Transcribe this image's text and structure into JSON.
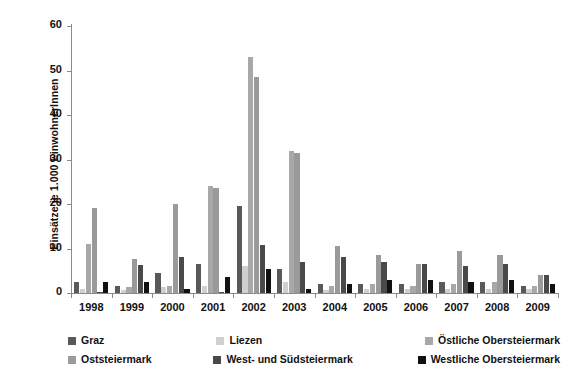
{
  "chart_data": {
    "type": "bar",
    "title": "",
    "subtitle": "",
    "xlabel": "",
    "ylabel": "Einsätze je 1.000 EinwohnerInnen",
    "ylim": [
      0,
      60
    ],
    "yticks": [
      0,
      10,
      20,
      30,
      40,
      50,
      60
    ],
    "ytick_labels": [
      "0",
      "10",
      "20",
      "30",
      "40",
      "50",
      "60"
    ],
    "grid": false,
    "legend_position": "bottom",
    "categories": [
      "1998",
      "1999",
      "2000",
      "2001",
      "2002",
      "2003",
      "2004",
      "2005",
      "2006",
      "2007",
      "2008",
      "2009"
    ],
    "series": [
      {
        "name": "Graz",
        "color": "#595959",
        "values": [
          2.5,
          1.6,
          4.6,
          6.6,
          19.6,
          5.5,
          2.0,
          2.0,
          2.0,
          2.5,
          2.5,
          1.5
        ]
      },
      {
        "name": "Liezen",
        "color": "#d0d0d0",
        "values": [
          1.0,
          0.6,
          1.4,
          1.5,
          6.0,
          2.5,
          0.6,
          1.0,
          1.0,
          1.0,
          1.0,
          1.0
        ]
      },
      {
        "name": "Östliche Obersteiermark",
        "color": "#a8a8a8",
        "values": [
          11.0,
          1.3,
          1.5,
          24.0,
          53.0,
          32.0,
          1.5,
          2.0,
          1.5,
          2.0,
          2.5,
          1.5
        ]
      },
      {
        "name": "Oststeiermark",
        "color": "#9a9a9a",
        "values": [
          19.0,
          7.7,
          20.0,
          23.5,
          48.5,
          31.5,
          10.5,
          8.5,
          6.5,
          9.5,
          8.5,
          4.0
        ]
      },
      {
        "name": "West- und Südsteiermark",
        "color": "#4a4a4a",
        "values": [
          0.2,
          6.4,
          8.0,
          0.2,
          10.8,
          7.0,
          8.0,
          7.0,
          6.5,
          6.0,
          6.5,
          4.0
        ]
      },
      {
        "name": "Westliche Obersteiermark",
        "color": "#111111",
        "values": [
          2.5,
          2.5,
          1.0,
          3.5,
          5.5,
          1.0,
          2.0,
          3.0,
          3.0,
          2.5,
          3.0,
          2.0
        ]
      }
    ]
  },
  "legend": {
    "items": [
      {
        "label": "Graz",
        "color": "#595959"
      },
      {
        "label": "Liezen",
        "color": "#d0d0d0"
      },
      {
        "label": "Östliche Obersteiermark",
        "color": "#a8a8a8"
      },
      {
        "label": "Oststeiermark",
        "color": "#9a9a9a"
      },
      {
        "label": "West- und Südsteiermark",
        "color": "#4a4a4a"
      },
      {
        "label": "Westliche Obersteiermark",
        "color": "#111111"
      }
    ]
  },
  "axis": {
    "y_title": "Einsätze je 1.000 EinwohnerInnen"
  }
}
